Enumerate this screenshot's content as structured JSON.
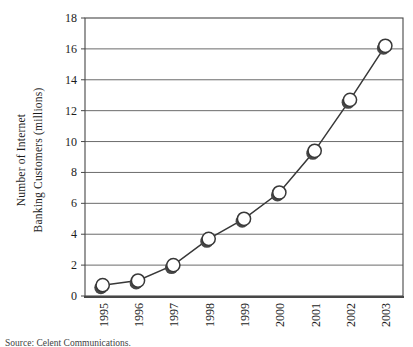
{
  "chart_data": {
    "type": "line",
    "title": "",
    "ylabel_lines": [
      "Number of Internet",
      "Banking Customers (millions)"
    ],
    "xlabel": "",
    "categories": [
      "1995",
      "1996",
      "1997",
      "1998",
      "1999",
      "2000",
      "2001",
      "2002",
      "2003"
    ],
    "series": [
      {
        "name": "Internet banking customers",
        "values": [
          0.7,
          1.0,
          2.0,
          3.7,
          5.0,
          6.7,
          9.4,
          12.7,
          16.2
        ]
      }
    ],
    "ylim": [
      0,
      18
    ],
    "yticks": [
      0,
      2,
      4,
      6,
      8,
      10,
      12,
      14,
      16,
      18
    ],
    "grid": "horizontal",
    "legend": "none",
    "marker": "open-circle-with-shadow",
    "colors": {
      "line": "#383838",
      "marker_fill": "#ffffff",
      "marker_stroke": "#383838",
      "marker_shadow": "#474747",
      "gridline": "#5a5a5a",
      "border": "#474747",
      "text": "#1c1c1c",
      "background": "#ffffff"
    },
    "source_note": "Source: Celent Communications."
  }
}
